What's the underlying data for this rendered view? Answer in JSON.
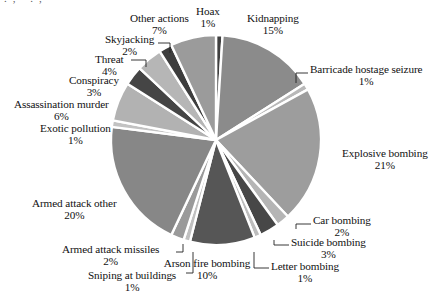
{
  "figure": {
    "background_color": "#ffffff",
    "text_color": "#111111",
    "cut_off_header_fragment": "., .,"
  },
  "chart_data": {
    "type": "pie",
    "title": "",
    "subtitle": "",
    "xlabel": "",
    "ylabel": "",
    "legend_position": "none",
    "labels_position": "outside-with-leader-lines",
    "grid": false,
    "start_angle_deg": 0,
    "direction": "clockwise",
    "units": "percent",
    "center": {
      "x": 216,
      "y": 140
    },
    "radius": 105,
    "categories": [
      "Hoax",
      "Kidnapping",
      "Barricade hostage seizure",
      "Explosive bombing",
      "Car bombing",
      "Suicide bombing",
      "Letter bombing",
      "Arson fire bombing",
      "Sniping at buildings",
      "Armed attack missiles",
      "Armed attack other",
      "Exotic pollution",
      "Assassination murder",
      "Conspiracy",
      "Threat",
      "Skyjacking",
      "Other actions"
    ],
    "values": [
      1,
      15,
      1,
      21,
      2,
      3,
      1,
      10,
      1,
      2,
      20,
      1,
      6,
      3,
      4,
      2,
      7
    ],
    "value_labels": [
      "1%",
      "15%",
      "1%",
      "21%",
      "2%",
      "3%",
      "1%",
      "10%",
      "1%",
      "2%",
      "20%",
      "1%",
      "6%",
      "3%",
      "4%",
      "2%",
      "7%"
    ],
    "colors": [
      "#3f3f3f",
      "#8b8b8b",
      "#b8b8b8",
      "#9d9d9d",
      "#b5b5b5",
      "#474747",
      "#bdbdbd",
      "#565656",
      "#c0c0c0",
      "#9a9a9a",
      "#878787",
      "#c2c2c2",
      "#b2b2b2",
      "#454545",
      "#b6b6b6",
      "#3d3d3d",
      "#9b9b9b"
    ],
    "slice_gap_color": "#ffffff"
  },
  "slices": [
    {
      "name": "Hoax",
      "value": 1,
      "pct_label": "1%",
      "color": "#3f3f3f",
      "label_x": 196,
      "label_y": 6,
      "align": "left",
      "leader": null
    },
    {
      "name": "Kidnapping",
      "value": 15,
      "pct_label": "15%",
      "color": "#8b8b8b",
      "label_x": 247,
      "label_y": 13,
      "align": "left",
      "leader": null
    },
    {
      "name": "Barricade hostage seizure",
      "value": 1,
      "pct_label": "1%",
      "color": "#b8b8b8",
      "label_x": 310,
      "label_y": 64,
      "align": "left",
      "leader": {
        "x1": 308,
        "y1": 73,
        "x2": 296,
        "y2": 83
      }
    },
    {
      "name": "Explosive bombing",
      "value": 21,
      "pct_label": "21%",
      "color": "#9d9d9d",
      "label_x": 342,
      "label_y": 148,
      "align": "left",
      "leader": null
    },
    {
      "name": "Car bombing",
      "value": 2,
      "pct_label": "2%",
      "color": "#b5b5b5",
      "label_x": 313,
      "label_y": 215,
      "align": "left",
      "leader": {
        "x1": 311,
        "y1": 224,
        "x2": 296,
        "y2": 229
      }
    },
    {
      "name": "Suicide bombing",
      "value": 3,
      "pct_label": "3%",
      "color": "#474747",
      "label_x": 291,
      "label_y": 237,
      "align": "left",
      "leader": {
        "x1": 289,
        "y1": 245,
        "x2": 274,
        "y2": 240
      }
    },
    {
      "name": "Letter bombing",
      "value": 1,
      "pct_label": "1%",
      "color": "#bdbdbd",
      "label_x": 271,
      "label_y": 261,
      "align": "left",
      "leader": {
        "x1": 269,
        "y1": 268,
        "x2": 254,
        "y2": 252
      }
    },
    {
      "name": "Arson fire bombing",
      "value": 10,
      "pct_label": "10%",
      "color": "#565656",
      "label_x": 207,
      "label_y": 258,
      "align": "center",
      "leader": null
    },
    {
      "name": "Sniping at buildings",
      "value": 1,
      "pct_label": "1%",
      "color": "#c0c0c0",
      "label_x": 88,
      "label_y": 270,
      "align": "left",
      "leader": {
        "x1": 186,
        "y1": 273,
        "x2": 193,
        "y2": 252
      }
    },
    {
      "name": "Armed attack missiles",
      "value": 2,
      "pct_label": "2%",
      "color": "#9a9a9a",
      "label_x": 62,
      "label_y": 244,
      "align": "left",
      "leader": {
        "x1": 176,
        "y1": 252,
        "x2": 183,
        "y2": 244
      }
    },
    {
      "name": "Armed attack other",
      "value": 20,
      "pct_label": "20%",
      "color": "#878787",
      "label_x": 32,
      "label_y": 198,
      "align": "left",
      "leader": null
    },
    {
      "name": "Exotic pollution",
      "value": 1,
      "pct_label": "1%",
      "color": "#c2c2c2",
      "label_x": 40,
      "label_y": 123,
      "align": "left",
      "leader": null
    },
    {
      "name": "Assassination murder",
      "value": 6,
      "pct_label": "6%",
      "color": "#b2b2b2",
      "label_x": 14,
      "label_y": 99,
      "align": "left",
      "leader": null
    },
    {
      "name": "Conspiracy",
      "value": 3,
      "pct_label": "3%",
      "color": "#454545",
      "label_x": 69,
      "label_y": 75,
      "align": "left",
      "leader": null
    },
    {
      "name": "Threat",
      "value": 4,
      "pct_label": "4%",
      "color": "#b6b6b6",
      "label_x": 95,
      "label_y": 54,
      "align": "left",
      "leader": {
        "x1": 131,
        "y1": 60,
        "x2": 146,
        "y2": 67
      }
    },
    {
      "name": "Skyjacking",
      "value": 2,
      "pct_label": "2%",
      "color": "#3d3d3d",
      "label_x": 105,
      "label_y": 34,
      "align": "left",
      "leader": {
        "x1": 158,
        "y1": 43,
        "x2": 170,
        "y2": 53
      }
    },
    {
      "name": "Other actions",
      "value": 7,
      "pct_label": "7%",
      "color": "#9b9b9b",
      "label_x": 130,
      "label_y": 13,
      "align": "left",
      "leader": null
    }
  ]
}
